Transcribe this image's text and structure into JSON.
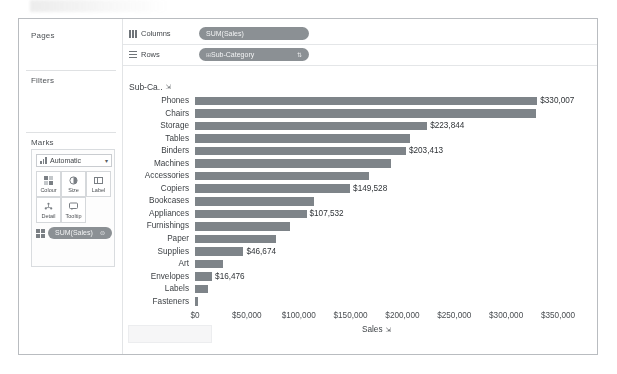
{
  "window": {
    "frame_border_color": "#b9bcc0",
    "background": "#ffffff"
  },
  "sidebar": {
    "pages": {
      "title": "Pages"
    },
    "filters": {
      "title": "Filters"
    },
    "marks": {
      "title": "Marks",
      "mark_type": "Automatic",
      "mark_type_caret": "▾",
      "mark_type_icon": "bar-chart-icon",
      "buttons": [
        {
          "label": "Colour",
          "icon": "colour-icon",
          "glyph": "▚"
        },
        {
          "label": "Size",
          "icon": "size-icon",
          "glyph": "◔"
        },
        {
          "label": "Label",
          "icon": "label-icon",
          "glyph": "⊞"
        },
        {
          "label": "Detail",
          "icon": "detail-icon",
          "glyph": "⁂"
        },
        {
          "label": "Tooltip",
          "icon": "tooltip-icon",
          "glyph": "💬"
        }
      ],
      "pill": {
        "text": "SUM(Sales)",
        "icon": "label-icon",
        "end_icon": "⊜"
      }
    }
  },
  "shelves": [
    {
      "name": "Columns",
      "icon": "columns-grid-icon",
      "pill": {
        "text": "SUM(Sales)",
        "icon": "",
        "sort": ""
      }
    },
    {
      "name": "Rows",
      "icon": "rows-grid-icon",
      "pill": {
        "text": "Sub-Category",
        "icon": "⊞",
        "sort": "⇅"
      }
    }
  ],
  "viz": {
    "row_header_title": "Sub-Ca..",
    "row_header_sort_icon": "sort-descending-icon",
    "row_header_sort_glyph": "⇲",
    "axis_sort_glyph": "⇲",
    "bar_color": "#7e8489",
    "label_color": "#2f3337"
  },
  "chart_data": {
    "type": "bar",
    "title": "",
    "subtitle": "",
    "orientation": "horizontal",
    "xlabel": "Sales",
    "ylabel": "Sub-Category",
    "xlim": [
      0,
      350000
    ],
    "xticks": [
      0,
      50000,
      100000,
      150000,
      200000,
      250000,
      300000,
      350000
    ],
    "xtick_labels": [
      "$0",
      "$50,000",
      "$100,000",
      "$150,000",
      "$200,000",
      "$250,000",
      "$300,000",
      "$350,000"
    ],
    "grid": false,
    "legend": "none",
    "measure": "SUM(Sales)",
    "sorted": "descending",
    "categories": [
      "Phones",
      "Chairs",
      "Storage",
      "Tables",
      "Binders",
      "Machines",
      "Accessories",
      "Copiers",
      "Bookcases",
      "Appliances",
      "Furnishings",
      "Paper",
      "Supplies",
      "Art",
      "Envelopes",
      "Labels",
      "Fasteners"
    ],
    "values": [
      330007,
      328449,
      223844,
      206966,
      203413,
      189239,
      167380,
      149528,
      114880,
      107532,
      91705,
      78479,
      46674,
      27119,
      16476,
      12486,
      3024
    ],
    "data_labels": [
      {
        "category": "Phones",
        "text": "$330,007",
        "shown": true
      },
      {
        "category": "Chairs",
        "text": "",
        "shown": false
      },
      {
        "category": "Storage",
        "text": "$223,844",
        "shown": true
      },
      {
        "category": "Tables",
        "text": "",
        "shown": false
      },
      {
        "category": "Binders",
        "text": "$203,413",
        "shown": true
      },
      {
        "category": "Machines",
        "text": "",
        "shown": false
      },
      {
        "category": "Accessories",
        "text": "",
        "shown": false
      },
      {
        "category": "Copiers",
        "text": "$149,528",
        "shown": true
      },
      {
        "category": "Bookcases",
        "text": "",
        "shown": false
      },
      {
        "category": "Appliances",
        "text": "$107,532",
        "shown": true
      },
      {
        "category": "Furnishings",
        "text": "",
        "shown": false
      },
      {
        "category": "Paper",
        "text": "",
        "shown": false
      },
      {
        "category": "Supplies",
        "text": "$46,674",
        "shown": true
      },
      {
        "category": "Art",
        "text": "",
        "shown": false
      },
      {
        "category": "Envelopes",
        "text": "$16,476",
        "shown": true
      },
      {
        "category": "Labels",
        "text": "",
        "shown": false
      },
      {
        "category": "Fasteners",
        "text": "",
        "shown": false
      }
    ]
  }
}
